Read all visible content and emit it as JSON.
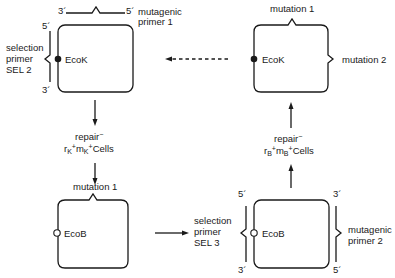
{
  "diagram": {
    "type": "site-directed mutagenesis selection cycle",
    "boxes": {
      "top_left": {
        "marker_label": "EcoK",
        "marker_style": "filled",
        "primer_top": {
          "left_end": "3´",
          "right_end": "5´",
          "label_line1": "mutagenic",
          "label_line2": "primer 1"
        },
        "primer_left": {
          "top_end": "5´",
          "bottom_end": "3´",
          "label_line1": "selection",
          "label_line2": "primer",
          "label_line3": "SEL 2"
        }
      },
      "top_right": {
        "marker_label": "EcoK",
        "marker_style": "filled",
        "top_annotation": "mutation 1",
        "right_annotation": "mutation 2"
      },
      "bottom_left": {
        "marker_label": "EcoB",
        "marker_style": "hollow",
        "top_annotation": "mutation 1"
      },
      "bottom_right": {
        "marker_label": "EcoB",
        "marker_style": "hollow",
        "primer_left": {
          "top_end": "5´",
          "bottom_end": "3´",
          "label_line1": "selection",
          "label_line2": "primer",
          "label_line3": "SEL 3"
        },
        "primer_right": {
          "top_end": "3´",
          "bottom_end": "5´",
          "label_line1": "mutagenic",
          "label_line2": "primer 2"
        }
      }
    },
    "steps": {
      "left": {
        "line1": "repair",
        "line1_sup": "−",
        "r": "r",
        "r_sub": "K",
        "r_sup": "+",
        "m": "m",
        "m_sub": "K",
        "m_sup": "+",
        "cells": "Cells"
      },
      "right": {
        "line1": "repair",
        "line1_sup": "−",
        "r": "r",
        "r_sub": "B",
        "r_sup": "+",
        "m": "m",
        "m_sub": "B",
        "m_sup": "+",
        "cells": "Cells"
      }
    },
    "colors": {
      "line": "#1a1a1a",
      "background": "#ffffff"
    }
  }
}
